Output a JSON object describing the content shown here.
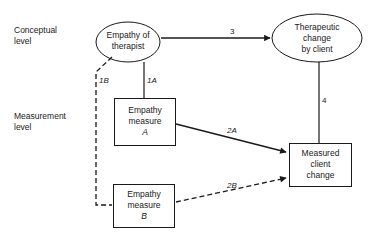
{
  "levels": {
    "conceptual": [
      "Conceptual",
      "level"
    ],
    "measurement": [
      "Measurement",
      "level"
    ]
  },
  "nodes": {
    "empathy_of_therapist": [
      "Empathy of",
      "therapist"
    ],
    "therapeutic_change": [
      "Therapeutic",
      "change",
      "by client"
    ],
    "empathy_measure_a": [
      "Empathy",
      "measure",
      "A"
    ],
    "empathy_measure_b": [
      "Empathy",
      "measure",
      "B"
    ],
    "measured_client_change": [
      "Measured",
      "client",
      "change"
    ]
  },
  "edges": {
    "e1A": "1A",
    "e1B": "1B",
    "e2A": "2A",
    "e2B": "2B",
    "e3": "3",
    "e4": "4"
  }
}
